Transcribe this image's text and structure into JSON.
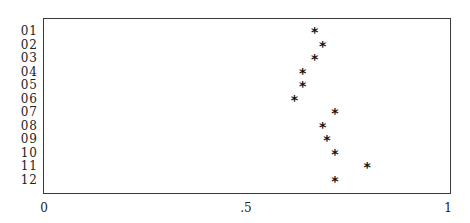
{
  "chart_data": {
    "type": "scatter",
    "title": "",
    "xlabel": "",
    "ylabel": "",
    "xlim": [
      0,
      1
    ],
    "x_ticks": [
      "0",
      ".5",
      "1"
    ],
    "x_tick_values": [
      0,
      0.5,
      1
    ],
    "grid": false,
    "legend": null,
    "marker": "*",
    "categories": [
      "01",
      "02",
      "03",
      "04",
      "05",
      "06",
      "07",
      "08",
      "09",
      "10",
      "11",
      "12"
    ],
    "values": [
      0.67,
      0.69,
      0.67,
      0.64,
      0.64,
      0.62,
      0.72,
      0.69,
      0.7,
      0.72,
      0.8,
      0.72
    ]
  },
  "layout": {
    "plot_left_px": 44,
    "plot_width_px": 404,
    "first_row_y_px": 31,
    "row_step_px": 13.5
  }
}
